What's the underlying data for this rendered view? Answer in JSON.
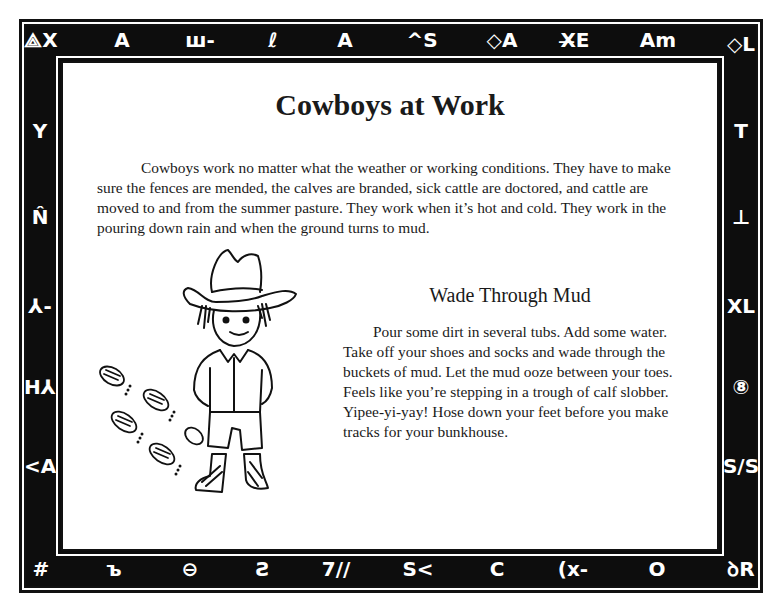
{
  "page": {
    "title": "Cowboys at Work",
    "intro_paragraph": "Cowboys work no matter what the weather or working conditions. They have to make sure the fences are mended, the calves are branded, sick cattle are doctored, and cattle are moved to and from the summer pasture. They work when it’s hot and cold. They work in the pouring down rain and when the ground turns to mud.",
    "activity": {
      "title": "Wade Through Mud",
      "body": "Pour some dirt in several tubs. Add some water. Take off your shoes and socks and wade through the buckets of mud. Let the mud ooze between your toes. Feels like you’re stepping in a trough of calf slobber. Yipee-yi-yay! Hose down your feet before you make tracks for your bunkhouse."
    },
    "illustration": "cowboy-boy-with-muddy-footprints"
  },
  "border": {
    "colors": {
      "band": "#0d0d0d",
      "glyph": "#ffffff",
      "paper": "#ffffff"
    },
    "top_brands": [
      "⟁X",
      "A",
      "ш-",
      "ℓ",
      "A",
      "^S",
      "◇A",
      "X̶E",
      "Am",
      "◇L"
    ],
    "left_brands": [
      "Y",
      "N̂",
      "⅄-",
      "H⅄",
      "<A"
    ],
    "right_brands": [
      "T",
      "⊥",
      "XL",
      "⑧",
      "S/S"
    ],
    "bottom_brands": [
      "#",
      "ъ",
      "⊖",
      "Ƨ",
      "7//",
      "S<",
      "C",
      "(x-",
      "O",
      "ꝺR"
    ]
  }
}
